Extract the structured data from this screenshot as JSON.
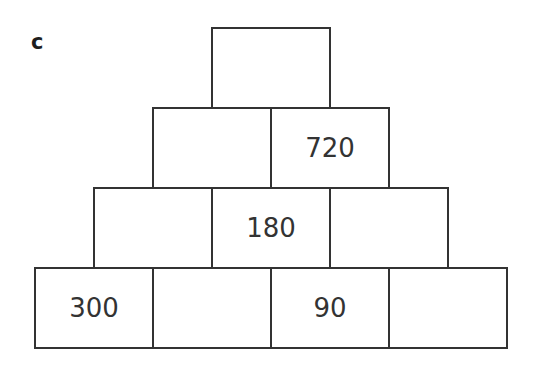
{
  "label": "c",
  "pyramid": {
    "rows": [
      [
        ""
      ],
      [
        "",
        "720"
      ],
      [
        "",
        "180",
        ""
      ],
      [
        "300",
        "",
        "90",
        ""
      ]
    ]
  }
}
